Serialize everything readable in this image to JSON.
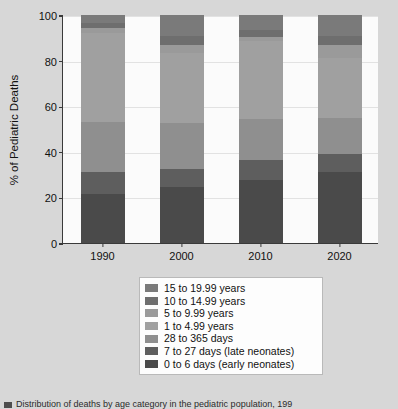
{
  "chart_data": {
    "type": "bar",
    "title": "",
    "subtitle": "",
    "stacked": true,
    "stack_total": 100,
    "xlabel": "",
    "ylabel": "% of Pediatric Deaths",
    "categories": [
      "1990",
      "2000",
      "2010",
      "2020"
    ],
    "ylim": [
      0,
      100
    ],
    "yticks": [
      0,
      20,
      40,
      60,
      80,
      100
    ],
    "grid": true,
    "legend_position": "below-center",
    "series": [
      {
        "name": "0 to 6 days (early neonates)",
        "color": "#4a4a4a",
        "values": [
          21.5,
          24.5,
          27.5,
          31.0
        ]
      },
      {
        "name": "7 to 27 days (late neonates)",
        "color": "#5e5e5e",
        "values": [
          9.5,
          8.0,
          9.0,
          8.0
        ]
      },
      {
        "name": "28 to 365 days",
        "color": "#8f8f8f",
        "values": [
          22.0,
          20.0,
          18.0,
          16.0
        ]
      },
      {
        "name": "1 to 4.99 years",
        "color": "#a0a0a0",
        "values": [
          39.0,
          31.0,
          34.0,
          26.0
        ]
      },
      {
        "name": "5 to 9.99 years",
        "color": "#9a9a9a",
        "values": [
          2.5,
          3.5,
          2.0,
          6.0
        ]
      },
      {
        "name": "10 to 14.99 years",
        "color": "#6e6e6e",
        "values": [
          2.0,
          4.0,
          3.0,
          4.0
        ]
      },
      {
        "name": "15 to 19.99 years",
        "color": "#7a7a7a",
        "values": [
          3.5,
          9.0,
          6.5,
          9.0
        ]
      }
    ]
  },
  "axes": {
    "y_label": "% of Pediatric Deaths",
    "y_ticks": [
      "0",
      "20",
      "40",
      "60",
      "80",
      "100"
    ],
    "x_ticks": [
      "1990",
      "2000",
      "2010",
      "2020"
    ]
  },
  "legend": {
    "items": [
      {
        "label": "15 to 19.99 years",
        "color": "#7a7a7a"
      },
      {
        "label": "10 to 14.99 years",
        "color": "#6e6e6e"
      },
      {
        "label": "5 to 9.99 years",
        "color": "#9a9a9a"
      },
      {
        "label": "1 to 4.99 years",
        "color": "#a0a0a0"
      },
      {
        "label": "28 to 365 days",
        "color": "#8f8f8f"
      },
      {
        "label": "7 to 27 days (late neonates)",
        "color": "#5e5e5e"
      },
      {
        "label": "0 to 6 days (early neonates)",
        "color": "#4a4a4a"
      }
    ]
  },
  "caption": {
    "text": "Distribution of deaths by age category in the pediatric population, 199"
  },
  "colors": {
    "figure_background": "#d7d7d7",
    "plot_background": "#fbfbfb",
    "axis": "#3a3a3a",
    "gridline": "#e2e2e2",
    "text": "#111111"
  }
}
